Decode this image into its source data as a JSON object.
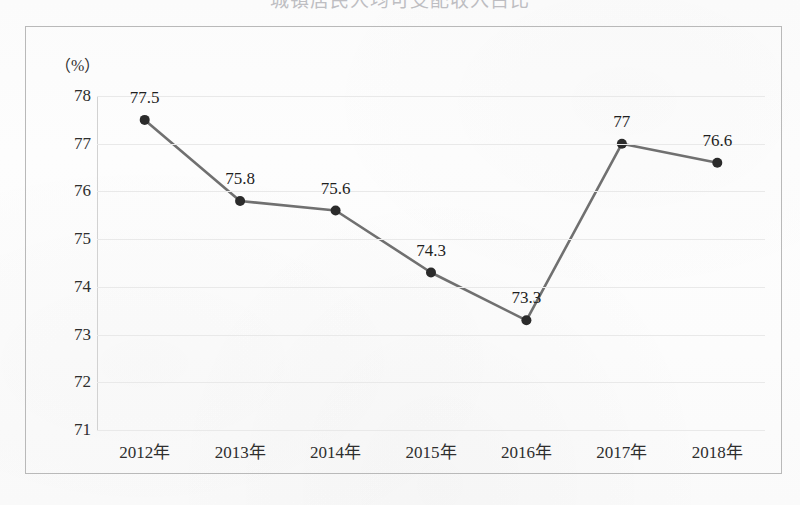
{
  "figure": {
    "title_partial": "城镇居民人均可支配收入占比",
    "axis_unit_label": "（%）"
  },
  "chart_data": {
    "type": "line",
    "title": "",
    "xlabel": "",
    "ylabel": "",
    "unit": "%",
    "categories": [
      "2012年",
      "2013年",
      "2014年",
      "2015年",
      "2016年",
      "2017年",
      "2018年"
    ],
    "values": [
      77.5,
      75.8,
      75.6,
      74.3,
      73.3,
      77,
      76.6
    ],
    "point_labels": [
      "77.5",
      "75.8",
      "75.6",
      "74.3",
      "73.3",
      "77",
      "76.6"
    ],
    "ylim": [
      71,
      78
    ],
    "yticks": [
      71,
      72,
      73,
      74,
      75,
      76,
      77,
      78
    ],
    "ytick_labels": [
      "71",
      "72",
      "73",
      "74",
      "75",
      "76",
      "77",
      "78"
    ],
    "grid": true,
    "grid_axis": "y",
    "legend": false,
    "legend_position": "none",
    "series": [
      {
        "name": "占比",
        "values": [
          77.5,
          75.8,
          75.6,
          74.3,
          73.3,
          77,
          76.6
        ],
        "line_color": "#707070",
        "marker_color": "#2b2b2b",
        "marker": "circle"
      }
    ]
  },
  "colors": {
    "line": "#707070",
    "marker": "#2b2b2b",
    "gridline": "#e9e9e9",
    "axis": "#d2d2d2",
    "frame": "#b9b9b9",
    "text": "#2e2e2e",
    "background": "#fcfcfc"
  }
}
